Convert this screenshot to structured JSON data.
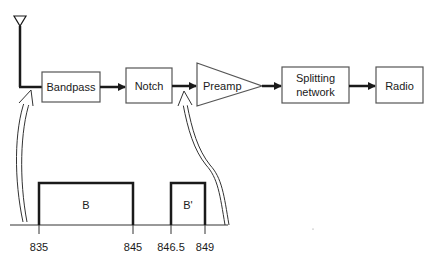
{
  "diagram": {
    "type": "block-diagram",
    "blocks": [
      {
        "id": "bandpass",
        "label": "Bandpass",
        "shape": "rect"
      },
      {
        "id": "notch",
        "label": "Notch",
        "shape": "rect"
      },
      {
        "id": "preamp",
        "label": "Preamp",
        "shape": "triangle"
      },
      {
        "id": "splitting",
        "label_line1": "Splitting",
        "label_line2": "network",
        "shape": "rect"
      },
      {
        "id": "radio",
        "label": "Radio",
        "shape": "rect"
      }
    ],
    "input": {
      "id": "antenna",
      "icon": "antenna-icon"
    },
    "connections": [
      [
        "antenna",
        "bandpass"
      ],
      [
        "bandpass",
        "notch"
      ],
      [
        "notch",
        "preamp"
      ],
      [
        "preamp",
        "splitting"
      ],
      [
        "splitting",
        "radio"
      ]
    ],
    "spectrum": {
      "bands": [
        {
          "label": "B",
          "start": "835",
          "end": "845"
        },
        {
          "label": "B'",
          "start": "846.5",
          "end": "849"
        }
      ],
      "tick_labels": [
        "835",
        "845",
        "846.5",
        "849"
      ]
    },
    "annotations": [
      {
        "from": "spectrum",
        "to": "antenna-bandpass-link",
        "icon": "double-arrow"
      },
      {
        "from": "spectrum",
        "to": "notch-preamp-link",
        "icon": "double-arrow"
      }
    ],
    "colors": {
      "stroke": "#1a1a1a",
      "background": "#ffffff",
      "box_stroke": "#444444"
    }
  }
}
